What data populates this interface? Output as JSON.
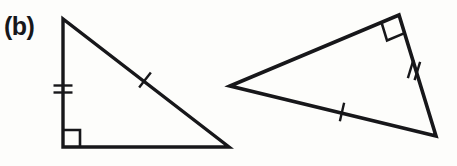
{
  "figure": {
    "part_label": "(b)",
    "background_color": "#fdfdfb",
    "stroke_color": "#17171a",
    "width": 457,
    "height": 166
  },
  "shapes": {
    "left_triangle": {
      "name": "left-right-triangle",
      "stroke_width": 3.4,
      "vertices": {
        "apex": [
          63,
          19
        ],
        "bottom_left": [
          63,
          147
        ],
        "bottom_right": [
          229,
          147
        ]
      },
      "right_angle_marker": {
        "at_vertex": "bottom_left",
        "size": 17,
        "stroke_width": 2.6
      },
      "tick_marks": [
        {
          "name": "double-tick-vertical-leg",
          "count": 2,
          "on_side": "apex-to-bottom-left",
          "center": [
            63,
            89
          ],
          "length": 19,
          "spacing": 7,
          "angle_deg": 0,
          "stroke_width": 2.4
        },
        {
          "name": "single-tick-hypotenuse",
          "count": 1,
          "on_side": "apex-to-bottom-right",
          "center": [
            145,
            80
          ],
          "length": 19,
          "spacing": 0,
          "angle_deg": 128,
          "stroke_width": 2.4
        }
      ]
    },
    "right_triangle": {
      "name": "right-rotated-right-triangle",
      "stroke_width": 3.6,
      "vertices": {
        "left_point": [
          230,
          86
        ],
        "top": [
          399,
          15
        ],
        "bottom_right": [
          436,
          136
        ]
      },
      "right_angle_marker": {
        "at_vertex": "top",
        "size": 19,
        "stroke_width": 2.6
      },
      "tick_marks": [
        {
          "name": "double-tick-right-side",
          "count": 2,
          "on_side": "top-to-bottom-right",
          "center": [
            414,
            70
          ],
          "length": 19,
          "spacing": 7,
          "angle_deg": 107,
          "stroke_width": 2.4
        },
        {
          "name": "single-tick-long-side",
          "count": 1,
          "on_side": "left-point-to-bottom-right",
          "center": [
            342,
            112
          ],
          "length": 19,
          "spacing": 0,
          "angle_deg": 103,
          "stroke_width": 2.4
        }
      ]
    }
  }
}
